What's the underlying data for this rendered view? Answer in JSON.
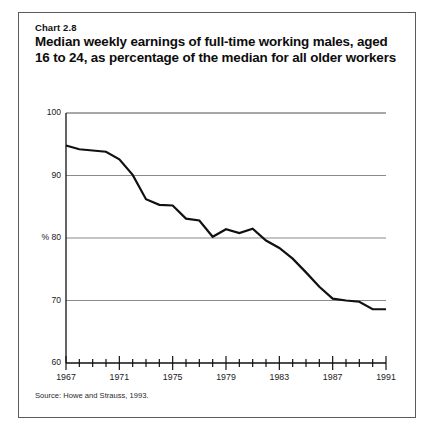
{
  "figure": {
    "number_label": "Chart 2.8",
    "title": "Median weekly earnings of full-time working males, aged 16 to 24, as percentage of the median for all older workers",
    "source": "Source: Howe and Strauss, 1993.",
    "border_color": "#5b5b5b"
  },
  "chart_data": {
    "type": "line",
    "title": "Median weekly earnings of full-time working males, aged 16 to 24, as percentage of the median for all older workers",
    "subtitle": "Chart 2.8",
    "xlabel": "",
    "ylabel": "%",
    "ylim": [
      60,
      100
    ],
    "xlim": [
      1967,
      1991
    ],
    "y_ticks": [
      60,
      70,
      80,
      90,
      100
    ],
    "y_tick_labels": [
      "60",
      "70",
      "% 80",
      "90",
      "100"
    ],
    "x_ticks": [
      1967,
      1968,
      1969,
      1970,
      1971,
      1972,
      1973,
      1974,
      1975,
      1976,
      1977,
      1978,
      1979,
      1980,
      1981,
      1982,
      1983,
      1984,
      1985,
      1986,
      1987,
      1988,
      1989,
      1990,
      1991
    ],
    "x_tick_labels": [
      "1967",
      "1971",
      "1975",
      "1979",
      "1983",
      "1987",
      "1991"
    ],
    "labeled_x_ticks": [
      1967,
      1971,
      1975,
      1979,
      1983,
      1987,
      1991
    ],
    "grid": "horizontal",
    "legend": "none",
    "line_color": "#111111",
    "gridline_color": "#8a8a8a",
    "x": [
      1967,
      1968,
      1969,
      1970,
      1971,
      1972,
      1973,
      1974,
      1975,
      1976,
      1977,
      1978,
      1979,
      1980,
      1981,
      1982,
      1983,
      1984,
      1985,
      1986,
      1987,
      1988,
      1989,
      1990,
      1991
    ],
    "values": [
      94.8,
      94.2,
      94.0,
      93.8,
      92.6,
      90.1,
      86.2,
      85.3,
      85.2,
      83.1,
      82.8,
      80.2,
      81.4,
      80.8,
      81.5,
      79.6,
      78.4,
      76.7,
      74.5,
      72.2,
      70.3,
      70.0,
      69.8,
      68.6,
      68.6
    ],
    "series": [
      {
        "name": "Median weekly earnings, males 16-24, as % of median for older workers",
        "values": [
          94.8,
          94.2,
          94.0,
          93.8,
          92.6,
          90.1,
          86.2,
          85.3,
          85.2,
          83.1,
          82.8,
          80.2,
          81.4,
          80.8,
          81.5,
          79.6,
          78.4,
          76.7,
          74.5,
          72.2,
          70.3,
          70.0,
          69.8,
          68.6,
          68.6
        ]
      }
    ]
  }
}
